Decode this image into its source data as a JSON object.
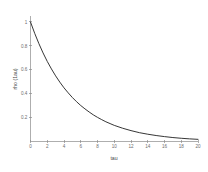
{
  "figure": {
    "background_color": "#ffffff",
    "curve_color": "#2b2b2b",
    "axis_color": "#8c8c8c",
    "tick_label_color": "#6d6d6d"
  },
  "chart_data": {
    "type": "line",
    "title": "",
    "xlabel": "tau",
    "ylabel": "rho (1au)",
    "xlim": [
      0,
      20
    ],
    "ylim": [
      0,
      1.05
    ],
    "grid": false,
    "legend": null,
    "x_ticks": [
      0,
      2,
      4,
      6,
      8,
      10,
      12,
      14,
      16,
      18,
      20
    ],
    "x_tick_labels": [
      "0",
      "2",
      "4",
      "6",
      "8",
      "10",
      "12",
      "14",
      "16",
      "18",
      "20"
    ],
    "y_ticks": [
      0.2,
      0.4,
      0.6,
      0.8,
      1
    ],
    "y_tick_labels": [
      "0.2",
      "0.4",
      "0.6",
      "0.8",
      "1"
    ],
    "series": [
      {
        "name": "rho",
        "description": "exponential decay, rho = exp(-tau/5)",
        "x": [
          0,
          0.5,
          1,
          1.5,
          2,
          2.5,
          3,
          3.5,
          4,
          4.5,
          5,
          5.5,
          6,
          6.5,
          7,
          7.5,
          8,
          8.5,
          9,
          9.5,
          10,
          11,
          12,
          13,
          14,
          15,
          16,
          17,
          18,
          19,
          20
        ],
        "values": [
          1,
          0.905,
          0.819,
          0.741,
          0.67,
          0.607,
          0.549,
          0.497,
          0.449,
          0.407,
          0.368,
          0.333,
          0.301,
          0.273,
          0.247,
          0.223,
          0.202,
          0.183,
          0.165,
          0.15,
          0.135,
          0.111,
          0.091,
          0.074,
          0.061,
          0.05,
          0.041,
          0.033,
          0.027,
          0.022,
          0.018
        ]
      }
    ]
  }
}
